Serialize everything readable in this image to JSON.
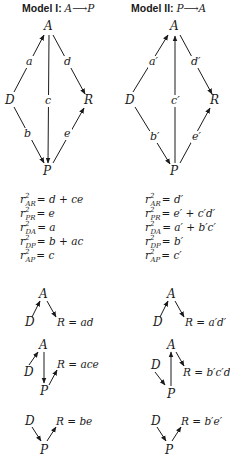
{
  "models": [
    {
      "title_prefix": "Model I: ",
      "title_path": "A⟶P",
      "nodes": {
        "A": "A",
        "D": "D",
        "R": "R",
        "P": "P"
      },
      "paths": {
        "a": "a",
        "b": "b",
        "c": "c",
        "d": "d",
        "e": "e"
      },
      "equations": [
        {
          "sub": "AR",
          "rhs": "= d + ce"
        },
        {
          "sub": "PR",
          "rhs": "= e"
        },
        {
          "sub": "DA",
          "rhs": "= a"
        },
        {
          "sub": "DP",
          "rhs": "= b + ac"
        },
        {
          "sub": "AP",
          "rhs": "= c"
        }
      ],
      "decompositions": [
        {
          "result": "R = ad"
        },
        {
          "result": "R = ace"
        },
        {
          "result": "R = be"
        }
      ]
    },
    {
      "title_prefix": "Model II: ",
      "title_path": "P⟶A",
      "nodes": {
        "A": "A",
        "D": "D",
        "R": "R",
        "P": "P"
      },
      "paths": {
        "a": "a′",
        "b": "b′",
        "c": "c′",
        "d": "d′",
        "e": "e′"
      },
      "equations": [
        {
          "sub": "AR",
          "rhs": "= d′"
        },
        {
          "sub": "PR",
          "rhs": "= e′ + c′d′"
        },
        {
          "sub": "DA",
          "rhs": "= a′ + b′c′"
        },
        {
          "sub": "DP",
          "rhs": "= b′"
        },
        {
          "sub": "AP",
          "rhs": "= c′"
        }
      ],
      "decompositions": [
        {
          "result": "R = a′d′"
        },
        {
          "result": "R = b′c′d′"
        },
        {
          "result": "R = b′e′"
        }
      ]
    }
  ],
  "equation_symbol": "r",
  "equation_power": "2"
}
